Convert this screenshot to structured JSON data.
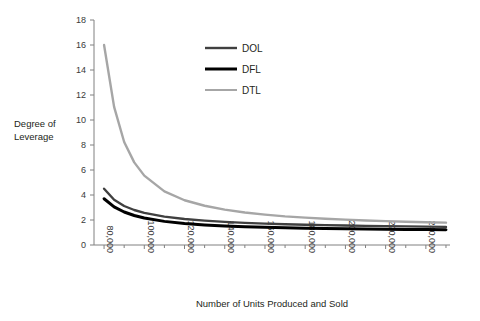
{
  "chart_data": {
    "type": "line",
    "title": "",
    "xlabel": "Number of Units Produced and Sold",
    "ylabel": "Degree of Leverage",
    "ylabel_line1": "Degree of",
    "ylabel_line2": "Leverage",
    "xlim": [
      75000,
      252000
    ],
    "ylim": [
      0,
      18
    ],
    "ytick_step": 2,
    "xtick_step": 20000,
    "grid": false,
    "legend_position": "upper-center",
    "y_ticks": [
      0,
      2,
      4,
      6,
      8,
      10,
      12,
      14,
      16,
      18
    ],
    "y_tick_labels": [
      "0",
      "2",
      "4",
      "6",
      "8",
      "10",
      "12",
      "14",
      "16",
      "18"
    ],
    "x_ticks": [
      80000,
      100000,
      120000,
      140000,
      160000,
      180000,
      200000,
      220000,
      240000
    ],
    "x_tick_labels": [
      "80,000",
      "100,000",
      "120,000",
      "140,000",
      "160,000",
      "180,000",
      "200,000",
      "220,000",
      "240,000"
    ],
    "x_tick_rotation": 90,
    "x": [
      80000,
      85000,
      90000,
      95000,
      100000,
      110000,
      120000,
      130000,
      140000,
      150000,
      160000,
      170000,
      180000,
      190000,
      200000,
      210000,
      220000,
      230000,
      240000,
      250000
    ],
    "series": [
      {
        "name": "DOL",
        "color": "#404040",
        "line_width": 2.4,
        "values": [
          4.5,
          3.62,
          3.12,
          2.8,
          2.57,
          2.27,
          2.08,
          1.95,
          1.85,
          1.77,
          1.71,
          1.66,
          1.62,
          1.59,
          1.56,
          1.53,
          1.51,
          1.49,
          1.47,
          1.45
        ]
      },
      {
        "name": "DFL",
        "color": "#000000",
        "line_width": 3.0,
        "values": [
          3.7,
          3.05,
          2.64,
          2.36,
          2.16,
          1.89,
          1.72,
          1.61,
          1.53,
          1.47,
          1.42,
          1.38,
          1.35,
          1.32,
          1.3,
          1.28,
          1.27,
          1.25,
          1.24,
          1.23
        ]
      },
      {
        "name": "DTL",
        "color": "#a6a6a6",
        "line_width": 2.4,
        "values": [
          16.0,
          11.05,
          8.24,
          6.61,
          5.55,
          4.29,
          3.58,
          3.14,
          2.83,
          2.6,
          2.43,
          2.29,
          2.19,
          2.1,
          2.03,
          1.96,
          1.91,
          1.86,
          1.82,
          1.79
        ]
      }
    ],
    "legend": [
      {
        "label": "DOL",
        "color": "#404040",
        "line_width": 2.4
      },
      {
        "label": "DFL",
        "color": "#000000",
        "line_width": 3.0
      },
      {
        "label": "DTL",
        "color": "#a6a6a6",
        "line_width": 2.0
      }
    ]
  },
  "axis_colors": {
    "axis": "#808080",
    "text": "#231f20",
    "background": "#ffffff"
  }
}
